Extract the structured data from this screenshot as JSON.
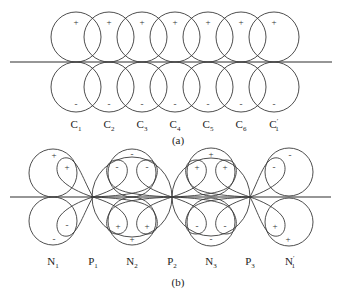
{
  "panel_a": {
    "caption": "(a)",
    "labels": [
      {
        "main": "C",
        "sub": "1"
      },
      {
        "main": "C",
        "sub": "2"
      },
      {
        "main": "C",
        "sub": "3"
      },
      {
        "main": "C",
        "sub": "4"
      },
      {
        "main": "C",
        "sub": "5"
      },
      {
        "main": "C",
        "sub": "6"
      },
      {
        "main": "C",
        "sub": "1",
        "prime": "′"
      }
    ],
    "upper_sign": "+",
    "lower_sign": "-"
  },
  "panel_b": {
    "caption": "(b)",
    "labels": [
      {
        "main": "N",
        "sub": "1"
      },
      {
        "main": "P",
        "sub": "1"
      },
      {
        "main": "N",
        "sub": "2"
      },
      {
        "main": "P",
        "sub": "2"
      },
      {
        "main": "N",
        "sub": "3"
      },
      {
        "main": "P",
        "sub": "3"
      },
      {
        "main": "N",
        "sub": "1",
        "prime": "′"
      }
    ],
    "signs": {
      "n1_upper_outer": "+",
      "n1_upper_loop": "+",
      "n1_lower_loop": "-",
      "n1_lower_outer": "-",
      "n2_upper_outer": "-",
      "n2_upper_left_loop": "-",
      "n2_upper_right_loop": "-",
      "n2_lower_left_loop": "+",
      "n2_lower_right_loop": "+",
      "n2_lower_outer": "+",
      "n3_upper_outer": "+",
      "n3_upper_left_loop": "+",
      "n3_upper_right_loop": "+",
      "n3_lower_left_loop": "-",
      "n3_lower_right_loop": "-",
      "n3_lower_outer": "-",
      "n1p_upper_outer": "-",
      "n1p_upper_loop": "-",
      "n1p_lower_loop": "+",
      "n1p_lower_outer": "+"
    }
  }
}
